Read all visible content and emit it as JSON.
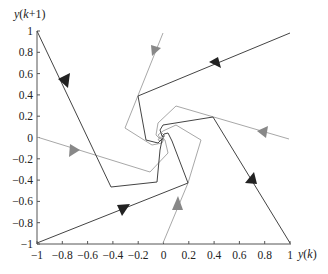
{
  "chart_data": {
    "type": "line",
    "title": "",
    "xlabel": "y(k)",
    "ylabel": "y(k+1)",
    "xlim": [
      -1,
      1
    ],
    "ylim": [
      -1,
      1
    ],
    "grid": false,
    "x_ticks": [
      "-1",
      "-0.8",
      "-0.6",
      "-0.4",
      "-0.2",
      "0",
      "0.2",
      "0.4",
      "0.6",
      "0.8",
      "1"
    ],
    "y_ticks": [
      "1",
      "0.8",
      "0.6",
      "0.4",
      "0.2",
      "0",
      "-0.2",
      "-0.4",
      "-0.6",
      "-0.8",
      "-1"
    ],
    "series": [
      {
        "name": "trajectory-1",
        "color": "#333333",
        "start": [
          -1,
          1
        ],
        "points": [
          [
            -1,
            1
          ],
          [
            -0.4,
            -0.47
          ],
          [
            -0.06,
            -0.42
          ],
          [
            -0.03,
            -0.12
          ],
          [
            -0.02,
            -0.02
          ],
          [
            0,
            0
          ]
        ]
      },
      {
        "name": "trajectory-2",
        "color": "#333333",
        "start": [
          1,
          1
        ],
        "points": [
          [
            1,
            1
          ],
          [
            -0.2,
            0.4
          ],
          [
            -0.13,
            -0.03
          ],
          [
            -0.04,
            -0.05
          ],
          [
            0,
            0
          ]
        ]
      },
      {
        "name": "trajectory-3",
        "color": "#333333",
        "start": [
          1,
          -1
        ],
        "points": [
          [
            1,
            -1
          ],
          [
            0.4,
            0.19
          ],
          [
            0,
            0.12
          ],
          [
            -0.02,
            0.07
          ],
          [
            0,
            0
          ]
        ]
      },
      {
        "name": "trajectory-4",
        "color": "#333333",
        "start": [
          -1,
          -1
        ],
        "points": [
          [
            -1,
            -1
          ],
          [
            0.2,
            -0.43
          ],
          [
            0.07,
            -0.03
          ],
          [
            0.04,
            0.04
          ],
          [
            0,
            0
          ]
        ]
      },
      {
        "name": "trajectory-5",
        "color": "#999999",
        "start": [
          0,
          -1
        ],
        "points": [
          [
            0,
            -1
          ],
          [
            0.2,
            -0.43
          ],
          [
            0.31,
            -0.03
          ],
          [
            0.1,
            0.12
          ],
          [
            0.02,
            0.02
          ],
          [
            0,
            0
          ]
        ]
      },
      {
        "name": "trajectory-6",
        "color": "#999999",
        "start": [
          -1,
          0
        ],
        "points": [
          [
            -1,
            0
          ],
          [
            -0.1,
            -0.33
          ],
          [
            0.04,
            -0.15
          ],
          [
            0.02,
            -0.02
          ],
          [
            0,
            0
          ]
        ]
      },
      {
        "name": "trajectory-7",
        "color": "#999999",
        "start": [
          0,
          1
        ],
        "points": [
          [
            0,
            1
          ],
          [
            -0.3,
            0.09
          ],
          [
            -0.09,
            -0.07
          ],
          [
            -0.02,
            -0.02
          ],
          [
            0,
            0
          ]
        ]
      },
      {
        "name": "trajectory-8",
        "color": "#999999",
        "start": [
          1,
          0
        ],
        "points": [
          [
            1,
            0
          ],
          [
            -0.1,
            0.3
          ],
          [
            -0.04,
            0.13
          ],
          [
            0,
            0.02
          ],
          [
            0,
            0
          ]
        ]
      }
    ],
    "arrows": [
      {
        "at": [
          -0.78,
          0.52
        ],
        "color": "#222222",
        "direction": "down-right"
      },
      {
        "at": [
          0.4,
          0.71
        ],
        "color": "#222222",
        "direction": "left"
      },
      {
        "at": [
          0.72,
          -0.35
        ],
        "color": "#222222",
        "direction": "up-left"
      },
      {
        "at": [
          -0.35,
          -0.65
        ],
        "color": "#222222",
        "direction": "right"
      },
      {
        "at": [
          0.14,
          -0.55
        ],
        "color": "#777777",
        "direction": "up"
      },
      {
        "at": [
          -0.7,
          -0.1
        ],
        "color": "#777777",
        "direction": "right"
      },
      {
        "at": [
          -0.05,
          0.7
        ],
        "color": "#777777",
        "direction": "down"
      },
      {
        "at": [
          0.65,
          0.05
        ],
        "color": "#777777",
        "direction": "left"
      }
    ]
  },
  "labels": {
    "ylabel": "y(k+1)",
    "xlabel": "y(k)"
  }
}
